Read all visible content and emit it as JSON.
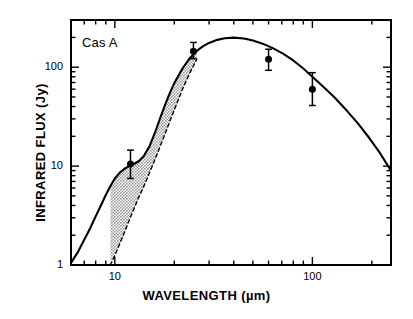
{
  "chart_data": {
    "type": "line",
    "title": "",
    "annotation": "Cas A",
    "xlabel": "WAVELENGTH (µm)",
    "ylabel": "INFRARED FLUX (Jy)",
    "xscale": "log",
    "yscale": "log",
    "xlim": [
      6,
      250
    ],
    "ylim": [
      1,
      300
    ],
    "grid": false,
    "legend": "none",
    "xtick_labels": [
      "10",
      "100"
    ],
    "xtick_values": [
      10,
      100
    ],
    "ytick_labels": [
      "1",
      "10",
      "100"
    ],
    "ytick_values": [
      1,
      10,
      100
    ],
    "xminor_values": [
      6,
      7,
      8,
      9,
      20,
      30,
      40,
      50,
      60,
      70,
      80,
      90,
      200
    ],
    "yminor_values": [
      2,
      3,
      4,
      5,
      6,
      7,
      8,
      9,
      20,
      30,
      40,
      50,
      60,
      70,
      80,
      90,
      200,
      300
    ],
    "points": [
      {
        "x": 12,
        "y": 10.5,
        "yerr_low": 7.5,
        "yerr_high": 14.5
      },
      {
        "x": 25,
        "y": 145,
        "yerr_low": 122,
        "yerr_high": 178
      },
      {
        "x": 60,
        "y": 120,
        "yerr_low": 93,
        "yerr_high": 152
      },
      {
        "x": 100,
        "y": 60,
        "yerr_low": 41,
        "yerr_high": 88
      }
    ],
    "series": [
      {
        "name": "two-component model",
        "style": "solid",
        "x": [
          6.0,
          6.5,
          7.0,
          7.5,
          8.0,
          8.5,
          9.0,
          9.5,
          10.0,
          10.6,
          11.2,
          11.8,
          12.5,
          13.2,
          14.0,
          15.0,
          16.0,
          17.0,
          18.0,
          19.0,
          20.0,
          22.0,
          24.0,
          26.0,
          28.0,
          30.0,
          33.0,
          36.0,
          40.0,
          45.0,
          50.0,
          56.0,
          63.0,
          71.0,
          80.0,
          90.0,
          100.0,
          115.0,
          130.0,
          150.0,
          170.0,
          195.0,
          220.0,
          250.0
        ],
        "y": [
          1.05,
          1.35,
          1.8,
          2.35,
          3.1,
          4.0,
          5.1,
          6.3,
          7.5,
          8.6,
          9.4,
          10.0,
          10.5,
          11.2,
          12.6,
          16.0,
          22.0,
          31.0,
          42.0,
          55.0,
          69.0,
          97.0,
          124.0,
          146.0,
          163.0,
          176.0,
          189.0,
          196.0,
          199.0,
          195.0,
          186.0,
          173.0,
          156.0,
          137.0,
          117.0,
          97.0,
          80.0,
          62.0,
          49.0,
          36.0,
          27.0,
          19.0,
          13.5,
          9.0
        ]
      },
      {
        "name": "single-component model",
        "style": "dashed",
        "x": [
          9.5,
          10.0,
          10.6,
          11.2,
          11.8,
          12.5,
          13.2,
          14.0,
          15.0,
          16.0,
          17.0,
          18.0,
          19.0,
          20.0,
          22.0,
          24.0,
          26.0
        ],
        "y": [
          1.0,
          1.25,
          1.65,
          2.15,
          2.8,
          3.7,
          4.8,
          6.2,
          8.6,
          11.8,
          16.0,
          21.5,
          28.5,
          37.0,
          60.0,
          88.0,
          120.0
        ]
      }
    ],
    "shaded_region": {
      "name": "excess-shaded-area",
      "color": "#9a9a9a",
      "between": [
        "two-component model",
        "single-component model"
      ]
    }
  }
}
